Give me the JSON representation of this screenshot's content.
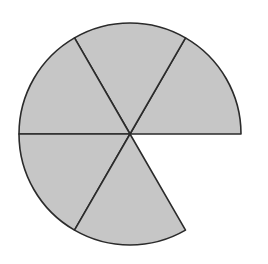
{
  "figure": {
    "title": "",
    "caption": "",
    "background_color": "#ffffff"
  },
  "chart_data": {
    "type": "pie",
    "title": "",
    "subtitle": "",
    "xlabel": "",
    "ylabel": "",
    "legend": [],
    "legend_position": "none",
    "grid": false,
    "total_sectors": 6,
    "shaded_sectors": 5,
    "missing_sectors": 1,
    "fraction_shaded": "5/6",
    "sector_angle_degrees": 60,
    "geometry": {
      "center_x": 130,
      "center_y": 134,
      "radius": 111,
      "stroke_color": "#2b2b2b",
      "stroke_width": 1.6,
      "fill_color": "#c6c6c6",
      "gap_fill_color": "#ffffff"
    },
    "categories": [
      "sector-1",
      "sector-2",
      "sector-3",
      "sector-4",
      "sector-5",
      "sector-6"
    ],
    "values": [
      60,
      60,
      60,
      60,
      60,
      60
    ],
    "sectors": [
      {
        "name": "sector-1",
        "label": "upper-right sector",
        "start_angle_degrees": 0,
        "end_angle_degrees": 60,
        "sweep_degrees": 60,
        "shaded": true,
        "fill": "#c6c6c6"
      },
      {
        "name": "sector-2",
        "label": "upper-middle sector",
        "start_angle_degrees": 60,
        "end_angle_degrees": 120,
        "sweep_degrees": 60,
        "shaded": true,
        "fill": "#c6c6c6"
      },
      {
        "name": "sector-3",
        "label": "upper-left sector",
        "start_angle_degrees": 120,
        "end_angle_degrees": 180,
        "sweep_degrees": 60,
        "shaded": true,
        "fill": "#c6c6c6"
      },
      {
        "name": "sector-4",
        "label": "lower-left sector",
        "start_angle_degrees": 180,
        "end_angle_degrees": 240,
        "sweep_degrees": 60,
        "shaded": true,
        "fill": "#c6c6c6"
      },
      {
        "name": "sector-5",
        "label": "lower-middle sector",
        "start_angle_degrees": 240,
        "end_angle_degrees": 300,
        "sweep_degrees": 60,
        "shaded": true,
        "fill": "#c6c6c6"
      },
      {
        "name": "sector-6",
        "label": "lower-right sector (missing)",
        "start_angle_degrees": 300,
        "end_angle_degrees": 360,
        "sweep_degrees": 60,
        "shaded": false,
        "fill": "#ffffff"
      }
    ]
  }
}
